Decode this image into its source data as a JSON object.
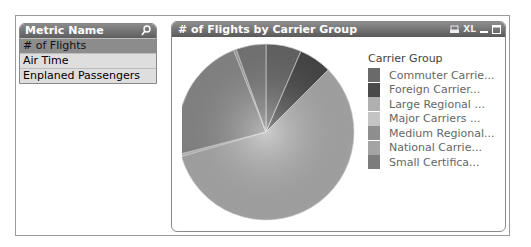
{
  "listbox": {
    "title": "Metric Name",
    "search_icon": "search-icon",
    "items": [
      {
        "label": "# of Flights",
        "state": "selected"
      },
      {
        "label": "Air Time",
        "state": "alternative"
      },
      {
        "label": "Enplaned Passengers",
        "state": "alternative"
      }
    ]
  },
  "chart_box": {
    "title": "# of Flights by Carrier Group",
    "icons": [
      "print-icon",
      "xl-export-icon",
      "minimize-icon",
      "maximize-icon"
    ],
    "xl_label": "XL"
  },
  "chart_data": {
    "type": "pie",
    "title": "# of Flights by Carrier Group",
    "legend_title": "Carrier Group",
    "legend_position": "right",
    "categories": [
      "Commuter Carrie...",
      "Foreign Carrier...",
      "Large Regional ...",
      "Major Carriers ...",
      "Medium Regional...",
      "National Carrie...",
      "Small Certifica..."
    ],
    "values": [
      6.5,
      6,
      58,
      0.5,
      23,
      0.5,
      5.5
    ],
    "colors": [
      "#6a6a6a",
      "#4a4a4a",
      "#b0b0b0",
      "#c4c4c4",
      "#8e8e8e",
      "#a4a4a4",
      "#7c7c7c"
    ]
  }
}
